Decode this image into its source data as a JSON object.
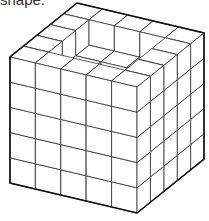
{
  "caption": "shape.",
  "diagram": {
    "type": "isometric cube stack",
    "grid_size": 5,
    "origin": [
      77,
      3
    ],
    "vec_a": [
      25.4,
      6.0
    ],
    "vec_b": [
      -13.4,
      10.8
    ],
    "unit_height": 25.2,
    "heights": [
      [
        5,
        5,
        5,
        5,
        5
      ],
      [
        5,
        4,
        4,
        4,
        5
      ],
      [
        5,
        4,
        3,
        3,
        5
      ],
      [
        5,
        4,
        3,
        2,
        5
      ],
      [
        5,
        5,
        5,
        5,
        5
      ]
    ],
    "stroke": "#333333",
    "outline_stroke": "#111111",
    "fill": "#ffffff"
  }
}
